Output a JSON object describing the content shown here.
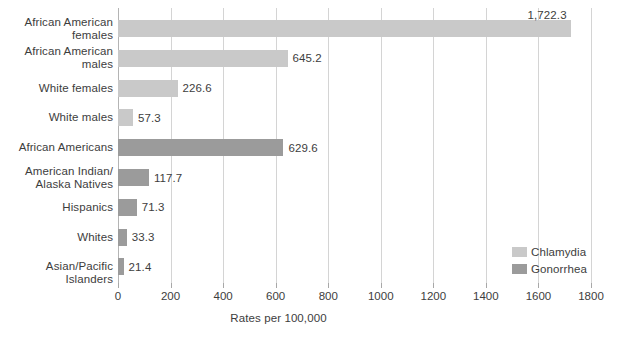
{
  "chart_data": {
    "type": "bar",
    "orientation": "horizontal",
    "title": "",
    "xlabel": "Rates per 100,000",
    "ylabel": "",
    "xlim": [
      0,
      1800
    ],
    "xticks": [
      0,
      200,
      400,
      600,
      800,
      1000,
      1200,
      1400,
      1600,
      1800
    ],
    "xtick_labels": [
      "0",
      "200",
      "400",
      "600",
      "800",
      "1000",
      "1200",
      "1400",
      "1600",
      "1800"
    ],
    "grid": true,
    "legend_position": "inside-right",
    "categories": [
      "African American females",
      "African American males",
      "White females",
      "White males",
      "African Americans",
      "American Indian/ Alaska Natives",
      "Hispanics",
      "Whites",
      "Asian/Pacific Islanders"
    ],
    "series": [
      {
        "name": "Chlamydia",
        "color": "#c9c9c9",
        "values": [
          1722.3,
          645.2,
          226.6,
          57.3,
          null,
          null,
          null,
          null,
          null
        ]
      },
      {
        "name": "Gonorrhea",
        "color": "#9b9b9b",
        "values": [
          null,
          null,
          null,
          null,
          629.6,
          117.7,
          71.3,
          33.3,
          21.4
        ]
      }
    ],
    "bars": [
      {
        "category_lines": [
          "African American",
          "females"
        ],
        "value": 1722.3,
        "value_label": "1,722.3",
        "series": "Chlamydia",
        "label_placement": "above"
      },
      {
        "category_lines": [
          "African American",
          "males"
        ],
        "value": 645.2,
        "value_label": "645.2",
        "series": "Chlamydia",
        "label_placement": "right"
      },
      {
        "category_lines": [
          "White females"
        ],
        "value": 226.6,
        "value_label": "226.6",
        "series": "Chlamydia",
        "label_placement": "right"
      },
      {
        "category_lines": [
          "White males"
        ],
        "value": 57.3,
        "value_label": "57.3",
        "series": "Chlamydia",
        "label_placement": "right"
      },
      {
        "category_lines": [
          "African Americans"
        ],
        "value": 629.6,
        "value_label": "629.6",
        "series": "Gonorrhea",
        "label_placement": "right"
      },
      {
        "category_lines": [
          "American Indian/",
          "Alaska Natives"
        ],
        "value": 117.7,
        "value_label": "117.7",
        "series": "Gonorrhea",
        "label_placement": "right"
      },
      {
        "category_lines": [
          "Hispanics"
        ],
        "value": 71.3,
        "value_label": "71.3",
        "series": "Gonorrhea",
        "label_placement": "right"
      },
      {
        "category_lines": [
          "Whites"
        ],
        "value": 33.3,
        "value_label": "33.3",
        "series": "Gonorrhea",
        "label_placement": "right"
      },
      {
        "category_lines": [
          "Asian/Pacific Islanders"
        ],
        "value": 21.4,
        "value_label": "21.4",
        "series": "Gonorrhea",
        "label_placement": "right"
      }
    ],
    "legend": [
      {
        "label": "Chlamydia",
        "color": "#c9c9c9"
      },
      {
        "label": "Gonorrhea",
        "color": "#9b9b9b"
      }
    ],
    "colors": {
      "chlamydia": "#c9c9c9",
      "gonorrhea": "#9b9b9b",
      "gridline": "#d4d4d4",
      "axis": "#b4b4b4",
      "text": "#3d3d3d",
      "background": "#ffffff"
    }
  }
}
